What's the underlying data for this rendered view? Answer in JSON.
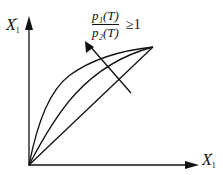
{
  "diagram": {
    "y_axis_label": {
      "main": "X",
      "sub": "1",
      "prime": "″"
    },
    "x_axis_label": {
      "main": "X",
      "sub": "1",
      "prime": "′"
    },
    "annotation": {
      "numerator": "p₁(T)",
      "denominator": "p₂(T)",
      "relation": "≥1"
    },
    "curves": [
      "upper-concave-curve",
      "middle-concave-curve",
      "diagonal-line"
    ],
    "arrow_direction": "increasing p1/p2 toward upper-left",
    "line_color": "#111111"
  }
}
